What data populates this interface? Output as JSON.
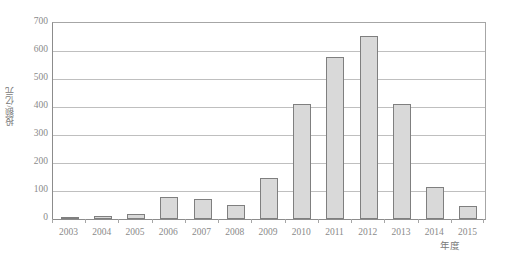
{
  "chart_data": {
    "type": "bar",
    "title": "",
    "subtitle": "",
    "xlabel": "年度",
    "ylabel": "投额/亿元",
    "categories": [
      "2003",
      "2004",
      "2005",
      "2006",
      "2007",
      "2008",
      "2009",
      "2010",
      "2011",
      "2012",
      "2013",
      "2014",
      "2015"
    ],
    "values": [
      4,
      9,
      17,
      80,
      70,
      50,
      148,
      410,
      580,
      655,
      410,
      115,
      45
    ],
    "series": [
      {
        "name": "投额",
        "values": [
          4,
          9,
          17,
          80,
          70,
          50,
          148,
          410,
          580,
          655,
          410,
          115,
          45
        ]
      }
    ],
    "ylim": [
      0,
      700
    ],
    "yticks": [
      0,
      100,
      200,
      300,
      400,
      500,
      600,
      700
    ],
    "ytick_labels": [
      "0",
      "100",
      "200",
      "300",
      "400",
      "500",
      "600",
      "700"
    ],
    "grid": true,
    "grid_axis": "y",
    "legend": false,
    "legend_position": "none",
    "bar_fill_color": "#d9d9d9",
    "bar_border_color": "#7f7f7f",
    "gridline_color": "#bfbfbf",
    "axis_color": "#8c8c8c",
    "text_color": "#8a8a8a",
    "background_color": "#ffffff"
  }
}
